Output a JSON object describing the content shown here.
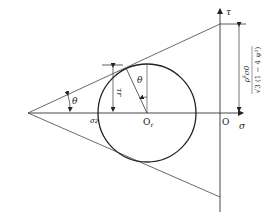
{
  "diagram": {
    "type": "mohr-circle-with-failure-envelope",
    "axes": {
      "sigma_label": "σ",
      "tau_label": "τ",
      "origin_label": "O"
    },
    "circle": {
      "center_label": "O",
      "center_subscript": "r",
      "radius_marker_label": "τr",
      "angle_label": "θ"
    },
    "envelope": {
      "apex_angle_label": "θ",
      "apex_stress_label": "σz"
    },
    "dimension": {
      "numerator": "ρ",
      "numerator_superscript": "k",
      "numerator_rest": "σ0",
      "denominator": "√3 (1 − 4 ψ²)"
    },
    "colors": {
      "line": "#333333",
      "circle": "#222222",
      "background": "#ffffff"
    }
  }
}
